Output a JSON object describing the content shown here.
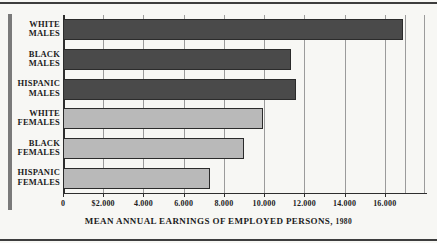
{
  "chart_data": {
    "type": "bar",
    "orientation": "horizontal",
    "title": "MEAN ANNUAL EARNINGS OF EMPLOYED PERSONS, 1980",
    "title_main": "MEAN ANNUAL EARNINGS OF EMPLOYED PERSONS,",
    "title_year": "1980",
    "xlabel": "",
    "ylabel": "",
    "categories": [
      "WHITE MALES",
      "BLACK MALES",
      "HISPANIC MALES",
      "WHITE FEMALES",
      "BLACK FEMALES",
      "HISPANIC FEMALES"
    ],
    "category_lines": [
      [
        "WHITE",
        "MALES"
      ],
      [
        "BLACK",
        "MALES"
      ],
      [
        "HISPANIC",
        "MALES"
      ],
      [
        "WHITE",
        "FEMALES"
      ],
      [
        "BLACK",
        "FEMALES"
      ],
      [
        "HISPANIC",
        "FEMALES"
      ]
    ],
    "values": [
      16900,
      11330,
      11580,
      9940,
      8990,
      7300
    ],
    "series": [
      {
        "name": "Mean annual earnings",
        "values": [
          16900,
          11330,
          11580,
          9940,
          8990,
          7300
        ]
      }
    ],
    "bar_group": [
      "male",
      "male",
      "male",
      "female",
      "female",
      "female"
    ],
    "colors": {
      "male_bar": "#4a4a4a",
      "female_bar": "#b9b9b9",
      "bar_outline": "#2b2b2b",
      "gridline": "#9b9b9b",
      "axis": "#2e2e2e",
      "background": "#f7f7f4",
      "text": "#1c1c1c",
      "spine": "#7a7a7a"
    },
    "xlim": [
      0,
      18000
    ],
    "xticks": [
      0,
      2000,
      4000,
      6000,
      8000,
      10000,
      12000,
      14000,
      16000
    ],
    "xtick_labels": [
      "0",
      "$2.000",
      "4.000",
      "6.000",
      "8.000",
      "10.000",
      "12.000",
      "14.000",
      "16.000"
    ],
    "grid": true,
    "grid_axis": "x",
    "legend": false,
    "legend_position": "none"
  }
}
